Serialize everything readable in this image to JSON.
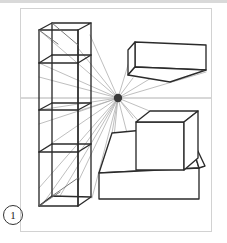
{
  "figure": {
    "number_label": "1",
    "caption": "",
    "frame": {
      "x": 20,
      "y": 8,
      "width": 192,
      "height": 224
    },
    "background_color": "#ffffff",
    "frame_border_color": "#d2d2d2",
    "top_rule_color": "#d9d9d9"
  },
  "style": {
    "object_stroke": "#2b2b2b",
    "object_stroke_width": 1.35,
    "ray_stroke": "#a9a9a9",
    "ray_stroke_width": 0.75,
    "horizon_stroke": "#b0b0b0",
    "horizon_stroke_width": 1,
    "vanishing_point_color": "#3a3a3a"
  },
  "perspective": {
    "type": "one-point-perspective",
    "vanishing_point": {
      "x": 118,
      "y": 98,
      "radius": 4.2,
      "name": "vanishing-point"
    },
    "horizon_line": {
      "x1": 21,
      "y1": 98,
      "x2": 211,
      "y2": 98,
      "name": "horizon-line"
    },
    "ray_endpoints": [
      {
        "x": 39,
        "y": 30
      },
      {
        "x": 39,
        "y": 63
      },
      {
        "x": 39,
        "y": 77
      },
      {
        "x": 39,
        "y": 110
      },
      {
        "x": 39,
        "y": 124
      },
      {
        "x": 39,
        "y": 152
      },
      {
        "x": 39,
        "y": 188
      },
      {
        "x": 42,
        "y": 205
      },
      {
        "x": 60,
        "y": 195
      },
      {
        "x": 78,
        "y": 48
      },
      {
        "x": 78,
        "y": 112
      },
      {
        "x": 78,
        "y": 180
      },
      {
        "x": 90,
        "y": 35
      },
      {
        "x": 90,
        "y": 196
      },
      {
        "x": 135,
        "y": 42
      },
      {
        "x": 135,
        "y": 78
      },
      {
        "x": 135,
        "y": 118
      },
      {
        "x": 135,
        "y": 168
      },
      {
        "x": 186,
        "y": 126
      },
      {
        "x": 186,
        "y": 170
      },
      {
        "x": 206,
        "y": 45
      },
      {
        "x": 206,
        "y": 70
      },
      {
        "x": 112,
        "y": 132
      },
      {
        "x": 112,
        "y": 175
      }
    ]
  },
  "objects": [
    {
      "name": "shelving-unit",
      "label": "shelving unit",
      "description": "Tall open bookcase drawn in one-point perspective on the left of the frame",
      "shelf_count": 4
    },
    {
      "name": "overhead-beam-box",
      "label": "overhead beam box",
      "description": "Long rectangular box seen from below, above the horizon at upper right"
    },
    {
      "name": "cube-on-platform",
      "label": "cube on platform",
      "description": "Cube resting on a rectangular slab platform at lower right"
    }
  ]
}
